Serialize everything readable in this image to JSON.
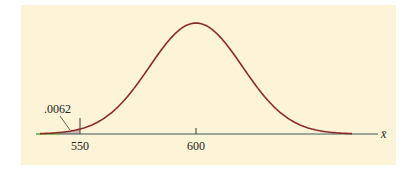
{
  "chart_data": {
    "type": "line",
    "title": "",
    "xlabel": "x̄",
    "ylabel": "",
    "x_ticks": [
      550,
      600
    ],
    "mean": 600,
    "shaded_region": {
      "from": "-inf",
      "to": 550,
      "area": ".0062"
    },
    "annotation": ".0062",
    "grid": false,
    "legend": null
  },
  "labels": {
    "tick_550": "550",
    "tick_600": "600",
    "axis_label": "x̄",
    "tail_area": ".0062"
  },
  "colors": {
    "background": "#fdf3d6",
    "curve": "#8b2a2a",
    "axis": "#3a5a5a",
    "shade": "#c9b8b0",
    "axis_left_accent": "#6cc04a"
  }
}
